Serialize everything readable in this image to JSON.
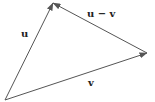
{
  "diagram": {
    "type": "vector-triangle",
    "colors": {
      "background": "#ffffff",
      "line": "#555555",
      "label": "#222222"
    },
    "points": {
      "origin": {
        "x": 5,
        "y": 100
      },
      "u_tip": {
        "x": 53,
        "y": 3
      },
      "v_tip": {
        "x": 147,
        "y": 53
      }
    },
    "vectors": [
      {
        "id": "u",
        "label": "u",
        "from": "origin",
        "to": "u_tip"
      },
      {
        "id": "v",
        "label": "v",
        "from": "origin",
        "to": "v_tip"
      },
      {
        "id": "u-minus-v",
        "label": "u − v",
        "from": "v_tip",
        "to": "u_tip"
      }
    ],
    "labels": {
      "u": "u",
      "v": "v",
      "u_minus_v": "u − v"
    }
  }
}
